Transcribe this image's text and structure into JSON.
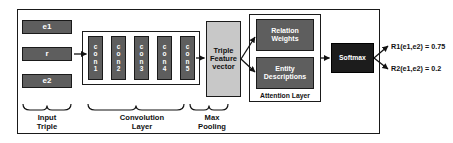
{
  "diagram": {
    "colors": {
      "block_dark": "#5e5e5e",
      "block_light": "#c8c8c8",
      "block_black": "#1c1c1c",
      "stroke": "#1a1a1a",
      "background": "#ffffff"
    },
    "input_triple": {
      "caption": "Input\nTriple",
      "caption_line1": "Input",
      "caption_line2": "Triple",
      "items": [
        {
          "label": "e1"
        },
        {
          "label": "r"
        },
        {
          "label": "e2"
        }
      ]
    },
    "convolution": {
      "caption_line1": "Convolution",
      "caption_line2": "Layer",
      "blocks": [
        {
          "label": "con1"
        },
        {
          "label": "con2"
        },
        {
          "label": "con3"
        },
        {
          "label": "con4"
        },
        {
          "label": "con5"
        }
      ]
    },
    "max_pooling": {
      "caption_line1": "Max",
      "caption_line2": "Pooling",
      "block": {
        "line1": "Triple",
        "line2": "Feature",
        "line3": "vector"
      }
    },
    "attention_layer": {
      "label": "Attention Layer",
      "blocks": [
        {
          "line1": "Relation",
          "line2": "Weights"
        },
        {
          "line1": "Entity",
          "line2": "Descriptions"
        }
      ]
    },
    "softmax": {
      "label": "Softmax"
    },
    "outputs": [
      {
        "label": "R1(e1,e2) = 0.75"
      },
      {
        "label": "R2(e1,e2) = 0.2"
      }
    ]
  }
}
